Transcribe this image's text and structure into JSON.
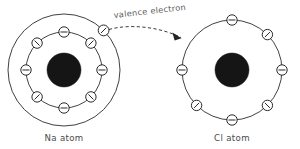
{
  "figure": {
    "background_color": "#ffffff",
    "line_color": "#2b2b2b",
    "nucleus_color": "#151515",
    "text_color": "#4a4a4a"
  },
  "annotation": {
    "label": "valence electron",
    "arrow_name": "transfer-arrow"
  },
  "atoms": [
    {
      "id": "na",
      "caption": "Na atom",
      "center": {
        "x": 64,
        "y": 70
      },
      "nucleus_radius": 17,
      "shells": [
        {
          "name": "inner-shell",
          "radius": 38,
          "electron_count": 8,
          "electron_angles_deg": [
            90,
            45,
            0,
            315,
            270,
            225,
            180,
            135
          ]
        },
        {
          "name": "outer-shell",
          "radius": 56,
          "electron_count": 1,
          "electron_angles_deg": [
            45
          ]
        }
      ]
    },
    {
      "id": "cl",
      "caption": "Cl atom",
      "center": {
        "x": 232,
        "y": 70
      },
      "nucleus_radius": 17,
      "shells": [
        {
          "name": "valence-shell",
          "radius": 50,
          "electron_count": 7,
          "electron_angles_deg": [
            90,
            45,
            0,
            315,
            270,
            225,
            180
          ]
        }
      ]
    }
  ],
  "electron_glyph": {
    "radius": 5.2,
    "symbol": "minus-sign",
    "description": "small open circle containing a short bar aligned tangent to its ring position"
  },
  "transfer": {
    "from_label": "Na valence electron",
    "to_label": "Cl valence shell",
    "start": {
      "x": 105,
      "y": 31
    },
    "end": {
      "x": 187,
      "y": 40
    },
    "style": "dashed-arrow"
  }
}
